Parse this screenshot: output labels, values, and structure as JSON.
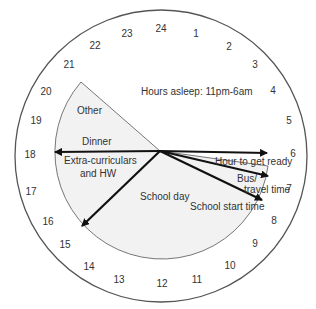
{
  "diagram": {
    "type": "24-hour clock schedule",
    "colors": {
      "background": "#ffffff",
      "outer_circle_stroke": "#555555",
      "sector_fill": "#f2f2f2",
      "sector_stroke": "#777777",
      "arrow": "#111111",
      "text": "#333333"
    },
    "hour_labels": [
      "24",
      "1",
      "2",
      "3",
      "4",
      "5",
      "6",
      "7",
      "8",
      "9",
      "10",
      "11",
      "12",
      "13",
      "14",
      "15",
      "16",
      "17",
      "18",
      "19",
      "20",
      "21",
      "22",
      "23"
    ],
    "labels": {
      "sleep": "Hours asleep: 11pm-6am",
      "other": "Other",
      "dinner": "Dinner",
      "extra_line1": "Extra-curriculars",
      "extra_line2": "and HW",
      "school_day": "School day",
      "get_ready": "Hour to get ready",
      "bus_line1": "Bus/",
      "bus_line2": "travel time",
      "school_start": "School start time"
    },
    "arrows": [
      {
        "name": "arrow-6am",
        "to_hour": 6
      },
      {
        "name": "arrow-7am",
        "to_hour": 7
      },
      {
        "name": "arrow-8am",
        "to_hour": 8
      },
      {
        "name": "arrow-3pm",
        "to_hour": 15
      },
      {
        "name": "arrow-6pm",
        "to_hour": 18
      }
    ]
  }
}
